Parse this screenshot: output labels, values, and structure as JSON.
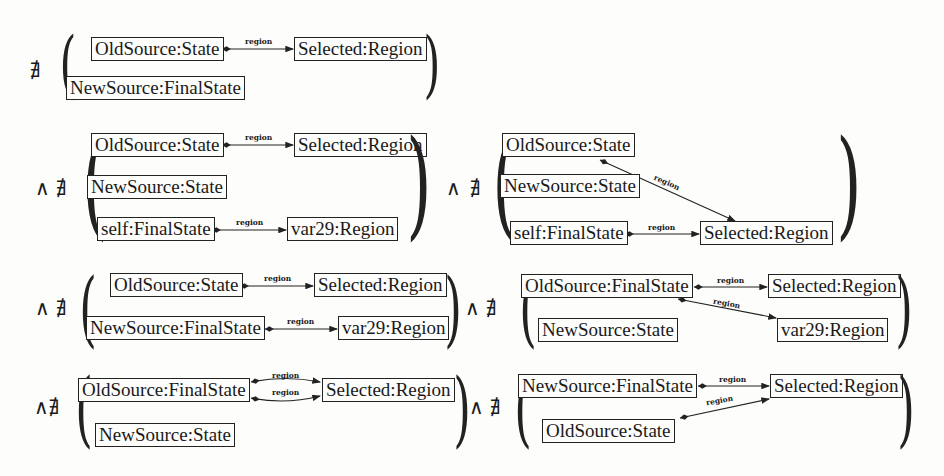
{
  "operators": {
    "not_exists": "∄",
    "and": "∧",
    "and_not_exists": "∧∄",
    "paren_open": "(",
    "paren_close": ")"
  },
  "edge_label": "region",
  "blocks": [
    {
      "id": "b1",
      "prefix": "∄",
      "nodes": [
        "OldSource:State",
        "Selected:Region",
        "NewSource:FinalState"
      ],
      "edges": [
        {
          "from": "OldSource:State",
          "to": "Selected:Region",
          "label": "region"
        }
      ]
    },
    {
      "id": "b2",
      "prefix": "∧ ∄",
      "nodes": [
        "OldSource:State",
        "Selected:Region",
        "NewSource:State",
        "self:FinalState",
        "var29:Region"
      ],
      "edges": [
        {
          "from": "OldSource:State",
          "to": "Selected:Region",
          "label": "region"
        },
        {
          "from": "self:FinalState",
          "to": "var29:Region",
          "label": "region"
        }
      ]
    },
    {
      "id": "b3",
      "prefix": "∧ ∄",
      "nodes": [
        "OldSource:State",
        "NewSource:State",
        "self:FinalState",
        "Selected:Region"
      ],
      "edges": [
        {
          "from": "OldSource:State",
          "to": "Selected:Region",
          "label": "region"
        },
        {
          "from": "self:FinalState",
          "to": "Selected:Region",
          "label": "region"
        }
      ]
    },
    {
      "id": "b4",
      "prefix": "∧ ∄",
      "nodes": [
        "OldSource:State",
        "Selected:Region",
        "NewSource:FinalState",
        "var29:Region"
      ],
      "edges": [
        {
          "from": "OldSource:State",
          "to": "Selected:Region",
          "label": "region"
        },
        {
          "from": "NewSource:FinalState",
          "to": "var29:Region",
          "label": "region"
        }
      ]
    },
    {
      "id": "b5",
      "prefix": "∧ ∄",
      "nodes": [
        "OldSource:FinalState",
        "Selected:Region",
        "NewSource:State",
        "var29:Region"
      ],
      "edges": [
        {
          "from": "OldSource:FinalState",
          "to": "Selected:Region",
          "label": "region"
        },
        {
          "from": "OldSource:FinalState",
          "to": "var29:Region",
          "label": "region"
        }
      ]
    },
    {
      "id": "b6",
      "prefix": "∧∄",
      "nodes": [
        "OldSource:FinalState",
        "Selected:Region",
        "NewSource:State"
      ],
      "edges": [
        {
          "from": "OldSource:FinalState",
          "to": "Selected:Region",
          "label": "region"
        },
        {
          "from": "OldSource:FinalState",
          "to": "Selected:Region",
          "label": "region"
        }
      ]
    },
    {
      "id": "b7",
      "prefix": "∧ ∄",
      "nodes": [
        "NewSource:FinalState",
        "Selected:Region",
        "OldSource:State"
      ],
      "edges": [
        {
          "from": "NewSource:FinalState",
          "to": "Selected:Region",
          "label": "region"
        },
        {
          "from": "OldSource:State",
          "to": "Selected:Region",
          "label": "region"
        }
      ]
    }
  ]
}
